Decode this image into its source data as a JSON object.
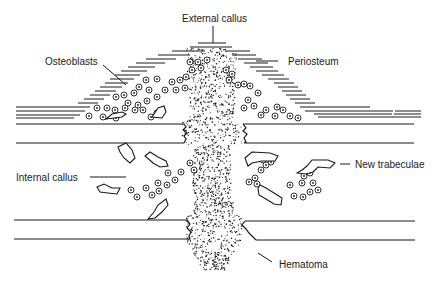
{
  "diagram": {
    "labels": {
      "external_callus": "External callus",
      "periosteum": "Periosteum",
      "osteoblasts": "Osteoblasts",
      "internal_callus": "Internal callus",
      "new_trabeculae": "New trabeculae",
      "hematoma": "Hematoma"
    },
    "colors": {
      "ink": "#1a1a1a",
      "background": "#ffffff"
    }
  }
}
